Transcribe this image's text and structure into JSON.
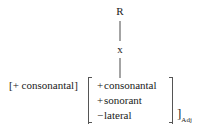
{
  "diagram": {
    "type": "phonological-feature-tree",
    "root_node": "R",
    "skeletal_slot": "x",
    "left_feature_bracket": "[+ consonantal]",
    "matrix": {
      "open_bracket": "[",
      "close_bracket": "]",
      "rows": [
        {
          "sign": "+",
          "feature": "consonantal"
        },
        {
          "sign": "+",
          "feature": "sonorant"
        },
        {
          "sign": "−",
          "feature": "lateral"
        }
      ]
    },
    "category_bracket": {
      "symbol": "]",
      "subscript": "Adj"
    },
    "edges": [
      {
        "from": "R",
        "to": "x"
      },
      {
        "from": "x",
        "to": "matrix"
      }
    ],
    "colors": {
      "background": "#ffffff",
      "text": "#1a1a1a",
      "rule": "#4a4a4a",
      "bracket": "#555555"
    }
  }
}
